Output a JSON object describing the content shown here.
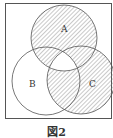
{
  "figure": {
    "caption": "図2",
    "sets": [
      {
        "label": "A",
        "cx": 64,
        "cy": 38,
        "r": 33
      },
      {
        "label": "B",
        "cx": 46,
        "cy": 81,
        "r": 34
      },
      {
        "label": "C",
        "cx": 81,
        "cy": 80,
        "r": 34
      }
    ],
    "shaded_regions": [
      "A only",
      "A∩B only",
      "A∩C only",
      "B∩C only",
      "C only"
    ],
    "unshaded_regions": [
      "B only",
      "A∩B∩C",
      "outside"
    ],
    "colors": {
      "line": "#555555",
      "hatch": "#777777",
      "background": "#ffffff"
    }
  }
}
